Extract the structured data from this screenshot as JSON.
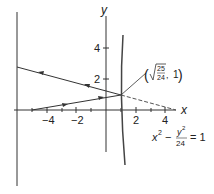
{
  "figure": {
    "axes": {
      "x_label": "x",
      "y_label": "y",
      "x_ticks": [
        {
          "value": -4,
          "label": "−4"
        },
        {
          "value": -2,
          "label": "−2"
        },
        {
          "value": 2,
          "label": "2"
        },
        {
          "value": 4,
          "label": "4"
        }
      ],
      "y_ticks": [
        {
          "value": 2,
          "label": "2"
        },
        {
          "value": 4,
          "label": "4"
        }
      ]
    },
    "point_label": {
      "open": "(",
      "radicand_num": "25",
      "radicand_den": "24",
      "sep": ", ",
      "y": "1",
      "close": ")"
    },
    "equation": {
      "x": "x",
      "x_exp": "2",
      "minus": "−",
      "y": "y",
      "y_exp": "2",
      "den": "24",
      "rhs": "= 1"
    },
    "stroke_color": "#333333"
  }
}
